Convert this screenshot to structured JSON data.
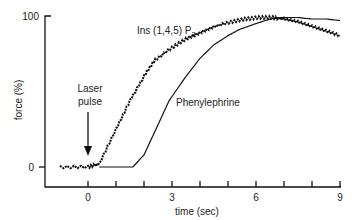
{
  "chart_data": {
    "type": "line",
    "title": "",
    "xlabel": "time (sec)",
    "ylabel": "force (%)",
    "xlim": [
      -1,
      9
    ],
    "ylim": [
      0,
      100
    ],
    "xticks": [
      0,
      3,
      6,
      9
    ],
    "yticks": [
      0,
      100
    ],
    "grid": false,
    "legend": "inline labels",
    "annotations": [
      {
        "text": "Laser pulse",
        "x": 0,
        "arrow": true
      }
    ],
    "series": [
      {
        "name": "Ins (1,4,5) P3",
        "style": "noisy",
        "x": [
          -1,
          0,
          0.4,
          1.0,
          1.5,
          2.0,
          2.4,
          3.0,
          3.5,
          4.0,
          4.5,
          5.1,
          5.6,
          6.1,
          6.6,
          7.0,
          7.5,
          8.0,
          8.5,
          9.0
        ],
        "y": [
          0,
          0,
          2,
          25,
          44,
          60,
          71,
          79,
          85,
          89,
          93,
          96,
          98,
          99,
          99,
          98,
          96,
          93,
          90,
          87
        ]
      },
      {
        "name": "Phenylephrine",
        "style": "smooth",
        "x": [
          0.4,
          1.0,
          1.6,
          2.0,
          2.5,
          2.9,
          3.5,
          4.0,
          4.5,
          5.0,
          5.4,
          6.0,
          6.5,
          6.9,
          7.5,
          8.0,
          8.5,
          9.0
        ],
        "y": [
          0,
          0,
          0,
          8,
          28,
          44,
          60,
          72,
          81,
          87,
          91,
          95,
          98,
          99,
          99,
          98,
          98,
          97
        ]
      }
    ]
  },
  "labels": {
    "ylabel": "force (%)",
    "xlabel": "time (sec)",
    "ytick_top": "100",
    "ytick_bottom": "0",
    "xtick_0": "0",
    "xtick_3": "3",
    "xtick_6": "6",
    "xtick_9": "9",
    "laser_line1": "Laser",
    "laser_line2": "pulse",
    "ip3_label": "Ins (1,4,5) P",
    "ip3_subscript": "3",
    "phenylephrine_label": "Phenylephrine"
  }
}
